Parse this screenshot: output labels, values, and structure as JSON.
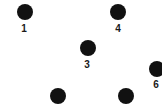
{
  "diagram": {
    "type": "dot-nodes",
    "dot_color": "#111111",
    "label_color": "#1a1a1a",
    "nodes": [
      {
        "id": "n1",
        "label": "1",
        "x": 25,
        "y": 12,
        "label_x": 24,
        "label_y": 29
      },
      {
        "id": "n4",
        "label": "4",
        "x": 118,
        "y": 12,
        "label_x": 118,
        "label_y": 29
      },
      {
        "id": "n3",
        "label": "3",
        "x": 88,
        "y": 48,
        "label_x": 87,
        "label_y": 65
      },
      {
        "id": "n6",
        "label": "6",
        "x": 157,
        "y": 69,
        "label_x": 156,
        "label_y": 85
      },
      {
        "id": "n-bottom-left",
        "label": "",
        "x": 58,
        "y": 96
      },
      {
        "id": "n-bottom-right",
        "label": "",
        "x": 126,
        "y": 96
      }
    ]
  }
}
